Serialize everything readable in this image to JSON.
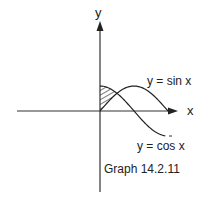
{
  "figure": {
    "caption": "Graph 14.2.11",
    "axes": {
      "x_label": "x",
      "y_label": "y"
    },
    "curves": [
      {
        "name": "sin",
        "label": "y = sin x"
      },
      {
        "name": "cos",
        "label": "y = cos x"
      }
    ],
    "shaded_region": "area between y-axis, y = cos x and y = sin x from x = 0 to x = π/4",
    "colors": {
      "ink": "#222222",
      "background": "#ffffff"
    }
  }
}
